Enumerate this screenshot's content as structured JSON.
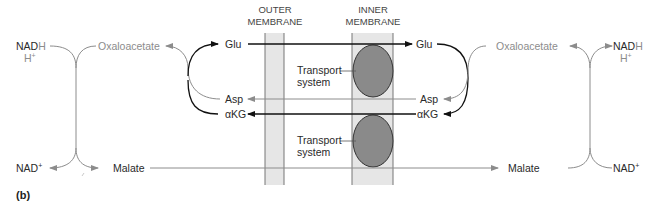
{
  "headers": {
    "outer_line1": "OUTER",
    "outer_line2": "MEMBRANE",
    "inner_line1": "INNER",
    "inner_line2": "MEMBRANE"
  },
  "left": {
    "nadh": "NAD",
    "nadh_h": "H",
    "hplus": "H",
    "hplus_sup": "+",
    "nad": "NAD",
    "nad_sup": "+",
    "oxaloacetate": "Oxaloacetate",
    "malate": "Malate",
    "glu": "Glu",
    "asp": "Asp",
    "akg": "αKG"
  },
  "right": {
    "nadh": "NAD",
    "nadh_h": "H",
    "hplus": "H",
    "hplus_sup": "+",
    "nad": "NAD",
    "nad_sup": "+",
    "oxaloacetate": "Oxaloacetate",
    "malate": "Malate",
    "glu": "Glu",
    "asp": "Asp",
    "akg": "αKG"
  },
  "transport": {
    "top_line1": "Transport",
    "top_line2": "system",
    "bottom_line1": "Transport",
    "bottom_line2": "system"
  },
  "panel_label": "(b)",
  "colors": {
    "membrane_fill": "#e6e6e6",
    "transporter_fill": "#8a8a8a",
    "dark_arrow": "#111111",
    "gray_arrow": "#8c8c8c"
  }
}
